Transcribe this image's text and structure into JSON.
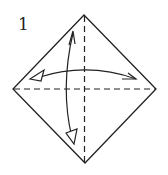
{
  "diagram": {
    "type": "origami-instruction",
    "step_number": "1",
    "colors": {
      "line": "#222222",
      "background": "#ffffff",
      "arrow_fill": "#ffffff"
    },
    "paper": {
      "shape": "diamond",
      "vertices": {
        "top": [
          84,
          15
        ],
        "right": [
          156,
          89
        ],
        "bottom": [
          85,
          163
        ],
        "left": [
          13,
          89
        ]
      }
    },
    "creases": [
      {
        "name": "vertical-valley-fold",
        "style": "dashed",
        "from": "top",
        "to": "bottom"
      },
      {
        "name": "horizontal-valley-fold",
        "style": "dashed",
        "from": "left",
        "to": "right"
      }
    ],
    "arrows": [
      {
        "name": "horizontal-fold-unfold-arrow",
        "direction": "left-right",
        "heads": [
          "hollow-left",
          "half-right"
        ]
      },
      {
        "name": "vertical-fold-unfold-arrow",
        "direction": "top-bottom",
        "heads": [
          "half-top",
          "hollow-bottom"
        ]
      }
    ]
  }
}
